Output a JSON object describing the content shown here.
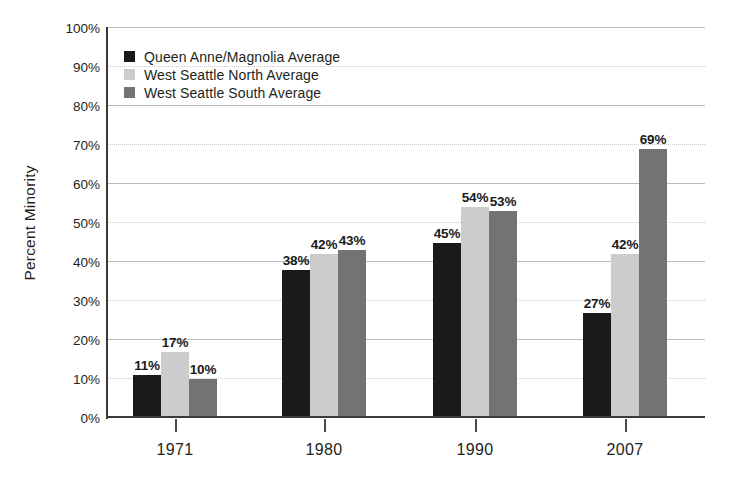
{
  "chart_data": {
    "type": "bar",
    "title": "",
    "subtitle": "",
    "xlabel": "",
    "ylabel": "Percent Minority",
    "ylim": [
      0,
      100
    ],
    "y_unit": "%",
    "grid": true,
    "grid_note": "horizontal gridlines; solid at 20/40/60/80/100, dotted at 10/30/50/70/90",
    "legend_position": "top-left inside plot",
    "categories": [
      "1971",
      "1980",
      "1990",
      "2007"
    ],
    "y_ticks": [
      "0%",
      "10%",
      "20%",
      "30%",
      "40%",
      "50%",
      "60%",
      "70%",
      "80%",
      "90%",
      "100%"
    ],
    "y_tick_values": [
      0,
      10,
      20,
      30,
      40,
      50,
      60,
      70,
      80,
      90,
      100
    ],
    "series": [
      {
        "name": "Queen Anne/Magnolia Average",
        "color": "#1a1a1a",
        "values": [
          11,
          38,
          45,
          27
        ],
        "labels": [
          "11%",
          "38%",
          "45%",
          "27%"
        ]
      },
      {
        "name": "West Seattle North Average",
        "color": "#cccccc",
        "values": [
          17,
          42,
          54,
          42
        ],
        "labels": [
          "17%",
          "42%",
          "54%",
          "42%"
        ]
      },
      {
        "name": "West Seattle South Average",
        "color": "#737373",
        "values": [
          10,
          43,
          53,
          69
        ],
        "labels": [
          "10%",
          "43%",
          "53%",
          "69%"
        ]
      }
    ]
  },
  "legend": {
    "items": [
      {
        "label": "Queen Anne/Magnolia Average",
        "color": "#1a1a1a"
      },
      {
        "label": "West Seattle North Average",
        "color": "#cccccc"
      },
      {
        "label": "West Seattle South Average",
        "color": "#737373"
      }
    ]
  },
  "axis": {
    "y_title": "Percent Minority"
  },
  "colors": {
    "series_1": "#1a1a1a",
    "series_2": "#cccccc",
    "series_3": "#737373",
    "axis": "#3a3a3a",
    "gridline_solid": "#bcbcbc",
    "gridline_dotted": "#c9c9c9",
    "text": "#231f20",
    "background": "#ffffff"
  }
}
